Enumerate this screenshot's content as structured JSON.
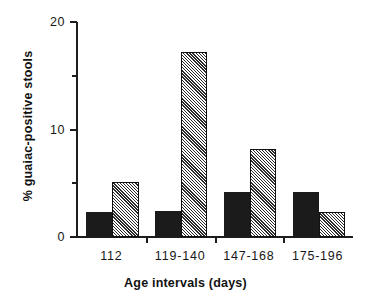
{
  "chart_data": {
    "type": "bar",
    "title": "",
    "xlabel": "Age intervals (days)",
    "ylabel": "% guaiac-positive stools",
    "categories": [
      "112",
      "119-140",
      "147-168",
      "175-196"
    ],
    "series": [
      {
        "name": "solid",
        "values": [
          2.3,
          2.4,
          4.2,
          4.2
        ]
      },
      {
        "name": "hatched",
        "values": [
          5.1,
          17.2,
          8.2,
          2.3
        ]
      }
    ],
    "ylim": [
      0,
      20
    ],
    "yticks": [
      0,
      10,
      20
    ],
    "ytick_labels": [
      "0",
      "10",
      "20"
    ],
    "yminor_ticks": [
      5,
      15
    ],
    "grid": false,
    "legend": "none",
    "colors": {
      "solid": "#1b1b1b",
      "hatched": "#2b2b2b",
      "axis": "#1d1d1d",
      "background": "#ffffff"
    }
  }
}
